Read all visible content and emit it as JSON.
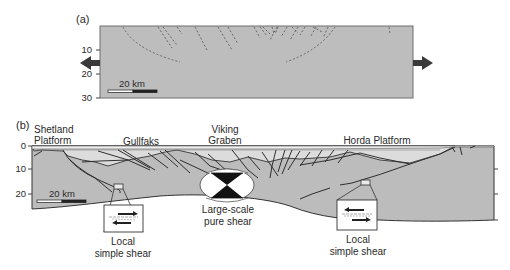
{
  "panel_a": {
    "tag": "(a)",
    "y_ticks": [
      "10",
      "20",
      "30"
    ],
    "scale_bar": "20 km",
    "arrows": [
      "extension-left",
      "extension-right"
    ],
    "fill_color": "#bdbdbd"
  },
  "panel_b": {
    "tag": "(b)",
    "y_ticks": [
      "0",
      "10",
      "20"
    ],
    "scale_bar": "20 km",
    "region_labels": {
      "shetland_line1": "Shetland",
      "shetland_line2": "Platform",
      "gullfaks": "Gullfaks",
      "viking_line1": "Viking",
      "viking_line2": "Graben",
      "horda": "Horda Platform"
    },
    "callouts": {
      "left_line1": "Local",
      "left_line2": "simple shear",
      "center_line1": "Large-scale",
      "center_line2": "pure shear",
      "right_line1": "Local",
      "right_line2": "simple shear"
    },
    "colors": {
      "crust": "#bcbcbc",
      "sediments": "#dcdcdc",
      "top_layer": "#eeeeee",
      "lines": "#333333"
    }
  }
}
